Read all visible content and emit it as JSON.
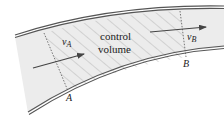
{
  "diagram": {
    "control_volume_label": [
      "control",
      "volume"
    ],
    "sections": [
      {
        "id": "A",
        "label": "A"
      },
      {
        "id": "B",
        "label": "B"
      }
    ],
    "velocities": [
      {
        "id": "vA",
        "symbol": "v",
        "subscript": "A"
      },
      {
        "id": "vB",
        "symbol": "v",
        "subscript": "B"
      }
    ],
    "colors": {
      "pipe_fill": "#ececec",
      "wall": "#555555",
      "hatch": "#a8a8a8",
      "arrow": "#444444",
      "text": "#222222"
    }
  }
}
